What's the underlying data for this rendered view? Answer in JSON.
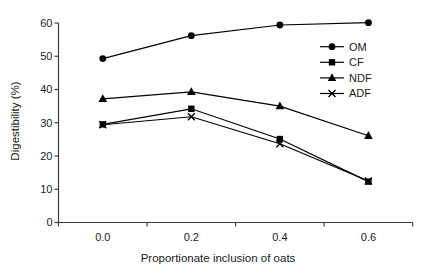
{
  "figure": {
    "background": "#ffffff",
    "series_color": "#000000",
    "axis_color": "#3f3f3f",
    "text_color": "#1a1a1a"
  },
  "chart_data": {
    "type": "line",
    "title": "",
    "xlabel": "Proportionate inclusion of oats",
    "ylabel": "Digestibility (%)",
    "categories": [
      "0.0",
      "0.2",
      "0.4",
      "0.6"
    ],
    "y_ticks": [
      0,
      10,
      20,
      30,
      40,
      50,
      60
    ],
    "ylim": [
      0,
      60
    ],
    "grid": false,
    "legend_position": "inside-right-top",
    "series": [
      {
        "name": "OM",
        "marker": "circle",
        "values": [
          49.3,
          56.2,
          59.4,
          60.1
        ]
      },
      {
        "name": "CF",
        "marker": "square",
        "values": [
          29.5,
          34.2,
          25.1,
          12.3
        ]
      },
      {
        "name": "NDF",
        "marker": "triangle",
        "values": [
          37.2,
          39.3,
          35.0,
          26.1
        ]
      },
      {
        "name": "ADF",
        "marker": "x-cross",
        "values": [
          29.4,
          31.8,
          23.7,
          12.5
        ]
      }
    ]
  }
}
